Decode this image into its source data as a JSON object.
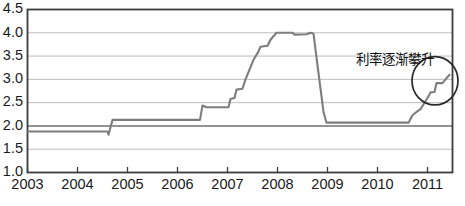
{
  "chart_data": {
    "type": "line",
    "title": "",
    "xlabel": "",
    "ylabel": "",
    "xlim": [
      2003.0,
      2011.5
    ],
    "ylim": [
      1.0,
      4.5
    ],
    "grid": true,
    "grid_axis": "y",
    "legend": "none",
    "line_color": "#7d7d7d",
    "axis_color": "#3c3c3c",
    "grid_color": "#b4b4b4",
    "x_ticks": [
      2003,
      2004,
      2005,
      2006,
      2007,
      2008,
      2009,
      2010,
      2011
    ],
    "x_tick_labels": [
      "2003",
      "2004",
      "2005",
      "2006",
      "2007",
      "2008",
      "2009",
      "2010",
      "2011"
    ],
    "y_ticks": [
      1.0,
      1.5,
      2.0,
      2.5,
      3.0,
      3.5,
      4.0,
      4.5
    ],
    "y_tick_labels": [
      "1.0",
      "1.5",
      "2.0",
      "2.5",
      "3.0",
      "3.5",
      "4.0",
      "4.5"
    ],
    "series": [
      {
        "name": "interest-rate",
        "points": [
          [
            2003.0,
            1.88
          ],
          [
            2004.6,
            1.88
          ],
          [
            2004.62,
            1.81
          ],
          [
            2004.7,
            2.13
          ],
          [
            2006.45,
            2.13
          ],
          [
            2006.5,
            2.44
          ],
          [
            2006.58,
            2.4
          ],
          [
            2007.02,
            2.4
          ],
          [
            2007.06,
            2.58
          ],
          [
            2007.14,
            2.6
          ],
          [
            2007.18,
            2.78
          ],
          [
            2007.3,
            2.8
          ],
          [
            2007.36,
            3.0
          ],
          [
            2007.52,
            3.42
          ],
          [
            2007.62,
            3.6
          ],
          [
            2007.66,
            3.7
          ],
          [
            2007.8,
            3.72
          ],
          [
            2007.86,
            3.85
          ],
          [
            2007.98,
            4.0
          ],
          [
            2008.3,
            4.0
          ],
          [
            2008.34,
            3.96
          ],
          [
            2008.58,
            3.97
          ],
          [
            2008.66,
            4.0
          ],
          [
            2008.72,
            3.98
          ],
          [
            2008.8,
            3.3
          ],
          [
            2008.92,
            2.3
          ],
          [
            2008.98,
            2.07
          ],
          [
            2010.62,
            2.07
          ],
          [
            2010.7,
            2.23
          ],
          [
            2010.78,
            2.3
          ],
          [
            2010.86,
            2.36
          ],
          [
            2011.0,
            2.6
          ],
          [
            2011.06,
            2.72
          ],
          [
            2011.14,
            2.73
          ],
          [
            2011.18,
            2.92
          ],
          [
            2011.3,
            2.92
          ],
          [
            2011.36,
            3.0
          ],
          [
            2011.44,
            3.1
          ]
        ]
      }
    ],
    "annotations": [
      {
        "type": "text",
        "name": "rate-climb-label",
        "text": "利率逐渐攀升",
        "x": 2010.35,
        "y": 3.42
      },
      {
        "type": "ellipse",
        "name": "highlight-circle",
        "cx": 2011.15,
        "cy": 2.97,
        "rx": 0.46,
        "ry": 0.52
      }
    ]
  }
}
